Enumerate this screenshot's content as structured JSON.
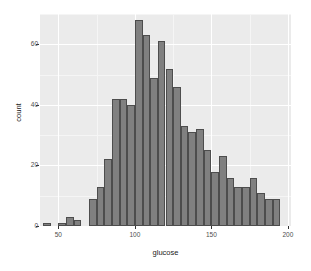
{
  "chart_data": {
    "type": "bar",
    "title": "",
    "subtitle": "",
    "xlabel": "glucose",
    "ylabel": "count",
    "xlim": [
      38,
      202
    ],
    "ylim": [
      0,
      70
    ],
    "bin_width": 5,
    "grid": true,
    "legend": null,
    "x_ticks": [
      50,
      100,
      150,
      200
    ],
    "y_ticks": [
      0,
      20,
      40,
      60
    ],
    "x_tick_labels": [
      "50",
      "100",
      "150",
      "200"
    ],
    "y_tick_labels": [
      "0",
      "20",
      "40",
      "60"
    ],
    "bin_starts": [
      40,
      45,
      50,
      55,
      60,
      65,
      70,
      75,
      80,
      85,
      90,
      95,
      100,
      105,
      110,
      115,
      120,
      125,
      130,
      135,
      140,
      145,
      150,
      155,
      160,
      165,
      170,
      175,
      180,
      185,
      190,
      195
    ],
    "categories": [
      "40-45",
      "45-50",
      "50-55",
      "55-60",
      "60-65",
      "65-70",
      "70-75",
      "75-80",
      "80-85",
      "85-90",
      "90-95",
      "95-100",
      "100-105",
      "105-110",
      "110-115",
      "115-120",
      "120-125",
      "125-130",
      "130-135",
      "135-140",
      "140-145",
      "145-150",
      "150-155",
      "155-160",
      "160-165",
      "165-170",
      "170-175",
      "175-180",
      "180-185",
      "185-190",
      "190-195",
      "195-200"
    ],
    "values": [
      1,
      0,
      1,
      3,
      2,
      0,
      9,
      13,
      22,
      42,
      42,
      40,
      68,
      63,
      49,
      61,
      52,
      46,
      33,
      31,
      32,
      25,
      18,
      23,
      16,
      13,
      13,
      16,
      11,
      9,
      9,
      0
    ],
    "bar_fill": "#808080",
    "bar_stroke": "#4d4d4d",
    "panel_background": "#ebebeb",
    "grid_color": "#ffffff"
  }
}
